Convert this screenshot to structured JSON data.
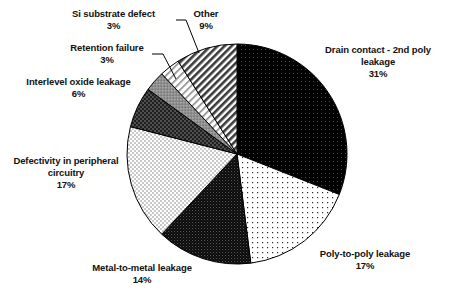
{
  "chart_data": {
    "type": "pie",
    "title": "",
    "subtitle": "",
    "xlabel": "",
    "ylabel": "",
    "legend_position": "none",
    "grid": false,
    "labels_show_percent": true,
    "start_angle_deg": 0,
    "direction": "clockwise",
    "categories": [
      "Drain contact - 2nd poly leakage",
      "Poly-to-poly leakage",
      "Metal-to-metal leakage",
      "Defectivity in peripheral circuitry",
      "Interlevel oxide leakage",
      "Retention failure",
      "Si substrate defect",
      "Other"
    ],
    "values": [
      31,
      17,
      14,
      17,
      6,
      3,
      3,
      9
    ],
    "slices": [
      {
        "name": "drain-contact",
        "label_line1": "Drain contact - 2nd poly",
        "label_line2": "leakage",
        "percent": "31%",
        "value": 31,
        "fill": "dark-dot",
        "base_color": "#000000"
      },
      {
        "name": "poly-to-poly",
        "label_line1": "Poly-to-poly leakage",
        "label_line2": "",
        "percent": "17%",
        "value": 17,
        "fill": "sparse-dot",
        "base_color": "#ffffff"
      },
      {
        "name": "metal-to-metal",
        "label_line1": "Metal-to-metal leakage",
        "label_line2": "",
        "percent": "14%",
        "value": 14,
        "fill": "dense-dark-dot",
        "base_color": "#111111"
      },
      {
        "name": "defectivity-peripheral",
        "label_line1": "Defectivity in peripheral",
        "label_line2": "circuitry",
        "percent": "17%",
        "value": 17,
        "fill": "light-checker",
        "base_color": "#e8e8e8"
      },
      {
        "name": "interlevel-oxide",
        "label_line1": "Interlevel oxide leakage",
        "label_line2": "",
        "percent": "6%",
        "value": 6,
        "fill": "dark-checker",
        "base_color": "#303030"
      },
      {
        "name": "retention-failure",
        "label_line1": "Retention failure",
        "label_line2": "",
        "percent": "3%",
        "value": 3,
        "fill": "mid-gray",
        "base_color": "#9a9a9a"
      },
      {
        "name": "si-substrate-defect",
        "label_line1": "Si substrate defect",
        "label_line2": "",
        "percent": "3%",
        "value": 3,
        "fill": "fine-diagonal",
        "base_color": "#d9d9d9"
      },
      {
        "name": "other",
        "label_line1": "Other",
        "label_line2": "",
        "percent": "9%",
        "value": 9,
        "fill": "bold-diagonal",
        "base_color": "#cfcfcf"
      }
    ],
    "colors": {
      "outline": "#000000",
      "text": "#111111",
      "background": "#ffffff",
      "leader_line": "#000000"
    }
  }
}
